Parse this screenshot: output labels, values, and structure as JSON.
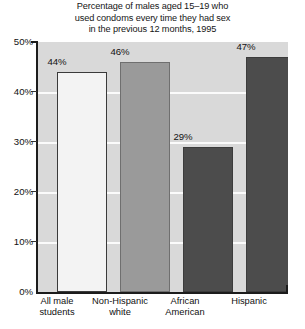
{
  "chart_data": {
    "type": "bar",
    "title": "Percentage of males aged 15–19 who used condoms every time they had sex in the previous 12 months, 1995",
    "title_lines": [
      "Percentage of males aged 15–19 who",
      "used condoms every time they had sex",
      "in the previous 12 months, 1995"
    ],
    "categories": [
      "All male students",
      "Non-Hispanic white",
      "African American",
      "Hispanic"
    ],
    "category_lines": [
      [
        "All male",
        "students"
      ],
      [
        "Non-Hispanic",
        "white"
      ],
      [
        "African",
        "American"
      ],
      [
        "Hispanic"
      ]
    ],
    "values": [
      44,
      46,
      29,
      47
    ],
    "value_labels": [
      "44%",
      "46%",
      "29%",
      "47%"
    ],
    "bar_colors": [
      "#f3f3f3",
      "#9a9a9a",
      "#4c4c4c",
      "#4c4c4c"
    ],
    "bar_styles": [
      "style-outline",
      "style-mid",
      "style-dark",
      "style-dark"
    ],
    "xlabel": "",
    "ylabel": "",
    "ylim": [
      0,
      50
    ],
    "yticks": [
      0,
      10,
      20,
      30,
      40,
      50
    ],
    "ytick_labels": [
      "0%",
      "10%",
      "20%",
      "30%",
      "40%",
      "50%"
    ],
    "grid": true,
    "gridlines_at": [
      10,
      20,
      30,
      40
    ],
    "legend": "none",
    "plot_background": "#d9d9d9",
    "gridline_color": "#fbfbfb",
    "axis_color": "#1c1c1c"
  }
}
